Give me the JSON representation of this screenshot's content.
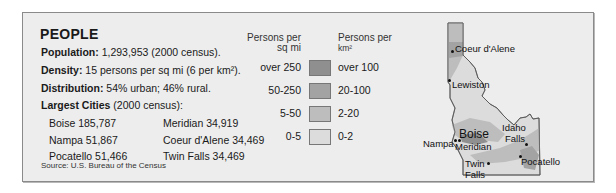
{
  "section": {
    "title": "PEOPLE",
    "population_label": "Population:",
    "population_value": " 1,293,953 (2000 census).",
    "density_label": "Density:",
    "density_value": " 15 persons per sq mi (6 per km²).",
    "distribution_label": "Distribution:",
    "distribution_value": " 54% urban; 46% rural.",
    "largest_label": "Largest Cities",
    "largest_value": " (2000 census):",
    "cities": [
      {
        "text": "Boise 185,787"
      },
      {
        "text": "Nampa 51,867"
      },
      {
        "text": "Pocatello 51,466"
      },
      {
        "text": "Idaho Falls 50,730"
      },
      {
        "text": "Meridian 34,919"
      },
      {
        "text": "Coeur d'Alene 34,469"
      },
      {
        "text": "Twin Falls 34,469"
      },
      {
        "text": "Lewiston 30,904"
      }
    ],
    "source": "Source: U.S. Bureau of the Census"
  },
  "legend": {
    "head_left_1": "Persons per",
    "head_left_2": "sq mi",
    "head_right_1": "Persons per",
    "head_right_2": "km²",
    "rows": [
      {
        "sq_mi": "over 250",
        "km2": "over 100",
        "color": "#8f8f8f"
      },
      {
        "sq_mi": "50-250",
        "km2": "20-100",
        "color": "#a3a3a3"
      },
      {
        "sq_mi": "5-50",
        "km2": "2-20",
        "color": "#bdbdbd"
      },
      {
        "sq_mi": "0-5",
        "km2": "0-2",
        "color": "#dcdcdc"
      }
    ]
  },
  "map": {
    "labels": {
      "coeur": "Coeur d'Alene",
      "lewiston": "Lewiston",
      "boise": "Boise",
      "nampa": "Nampa",
      "meridian": "Meridian",
      "idaho_falls_1": "Idaho",
      "idaho_falls_2": "Falls",
      "twin_1": "Twin",
      "twin_2": "Falls",
      "pocatello": "Pocatello"
    }
  }
}
